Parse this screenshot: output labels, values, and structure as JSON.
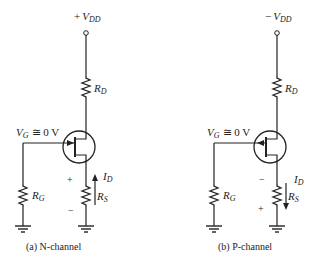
{
  "circuits": [
    {
      "id": "n-channel",
      "supply": {
        "sign": "+",
        "var": "V",
        "sub": "DD"
      },
      "drain_resistor": {
        "var": "R",
        "sub": "D"
      },
      "gate_voltage": {
        "var": "V",
        "sub": "G",
        "rel": "≅ 0 V"
      },
      "gate_resistor": {
        "var": "R",
        "sub": "G"
      },
      "source_resistor": {
        "var": "R",
        "sub": "S"
      },
      "current": {
        "var": "I",
        "sub": "D",
        "direction": "up"
      },
      "polarity": {
        "top": "+",
        "bottom": "−"
      },
      "caption": "(a) N-channel"
    },
    {
      "id": "p-channel",
      "supply": {
        "sign": "−",
        "var": "V",
        "sub": "DD"
      },
      "drain_resistor": {
        "var": "R",
        "sub": "D"
      },
      "gate_voltage": {
        "var": "V",
        "sub": "G",
        "rel": "≅ 0 V"
      },
      "gate_resistor": {
        "var": "R",
        "sub": "G"
      },
      "source_resistor": {
        "var": "R",
        "sub": "S"
      },
      "current": {
        "var": "I",
        "sub": "D",
        "direction": "down"
      },
      "polarity": {
        "top": "−",
        "bottom": "+"
      },
      "caption": "(b) P-channel"
    }
  ]
}
